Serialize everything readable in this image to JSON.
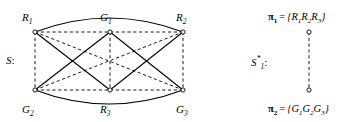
{
  "figure": {
    "left_diagram": {
      "set_label": {
        "base": "S",
        "colon": ":"
      },
      "nodes": [
        {
          "id": "R1",
          "base": "R",
          "sub": "1",
          "x": 35,
          "y": 32,
          "label_x": 22,
          "label_y": 12,
          "label_anchor": "start"
        },
        {
          "id": "G1",
          "base": "G",
          "sub": "1",
          "x": 110,
          "y": 32,
          "label_x": 100,
          "label_y": 12,
          "label_anchor": "start"
        },
        {
          "id": "R2",
          "base": "R",
          "sub": "2",
          "x": 183,
          "y": 32,
          "label_x": 176,
          "label_y": 12,
          "label_anchor": "start"
        },
        {
          "id": "G2",
          "base": "G",
          "sub": "2",
          "x": 35,
          "y": 90,
          "label_x": 22,
          "label_y": 104,
          "label_anchor": "start"
        },
        {
          "id": "R3",
          "base": "R",
          "sub": "3",
          "x": 110,
          "y": 90,
          "label_x": 100,
          "label_y": 104,
          "label_anchor": "start"
        },
        {
          "id": "G3",
          "base": "G",
          "sub": "3",
          "x": 183,
          "y": 90,
          "label_x": 176,
          "label_y": 104,
          "label_anchor": "start"
        }
      ],
      "edges": [
        {
          "name": "edge-R1-G1",
          "from": "R1",
          "to": "G1",
          "style": "dashed",
          "kind": "line"
        },
        {
          "name": "edge-G1-R2",
          "from": "G1",
          "to": "R2",
          "style": "dashed",
          "kind": "line"
        },
        {
          "name": "edge-G2-R3",
          "from": "G2",
          "to": "R3",
          "style": "dashed",
          "kind": "line"
        },
        {
          "name": "edge-R3-G3",
          "from": "R3",
          "to": "G3",
          "style": "dashed",
          "kind": "line"
        },
        {
          "name": "edge-R1-G2",
          "from": "R1",
          "to": "G2",
          "style": "dashed",
          "kind": "line"
        },
        {
          "name": "edge-G1-R3",
          "from": "G1",
          "to": "R3",
          "style": "dashed",
          "kind": "line"
        },
        {
          "name": "edge-R2-G3",
          "from": "R2",
          "to": "G3",
          "style": "dashed",
          "kind": "line"
        },
        {
          "name": "edge-R1-G3",
          "from": "R1",
          "to": "G3",
          "style": "dashed",
          "kind": "line"
        },
        {
          "name": "edge-G2-R2",
          "from": "G2",
          "to": "R2",
          "style": "dashed",
          "kind": "line"
        },
        {
          "name": "edge-R1-R3",
          "from": "R1",
          "to": "R3",
          "style": "solid",
          "kind": "line"
        },
        {
          "name": "edge-R2-R3",
          "from": "R2",
          "to": "R3",
          "style": "solid",
          "kind": "line"
        },
        {
          "name": "edge-G1-G2",
          "from": "G1",
          "to": "G2",
          "style": "solid",
          "kind": "line"
        },
        {
          "name": "edge-G1-G3",
          "from": "G1",
          "to": "G3",
          "style": "solid",
          "kind": "line"
        },
        {
          "name": "edge-R1-R2",
          "from": "R1",
          "to": "R2",
          "style": "solid",
          "kind": "arc",
          "bow": -28
        },
        {
          "name": "edge-G2-G3",
          "from": "G2",
          "to": "G3",
          "style": "solid",
          "kind": "arc",
          "bow": 28
        }
      ]
    },
    "right_diagram": {
      "set_label": {
        "base": "S",
        "sub": "1",
        "sup": "*",
        "colon": ":"
      },
      "partitions": [
        {
          "name": "partition-pi-1",
          "pi": "π",
          "pi_sub": "1",
          "eq": "=",
          "open": "{",
          "members": [
            {
              "base": "R",
              "sub": "1"
            },
            {
              "base": "R",
              "sub": "2"
            },
            {
              "base": "R",
              "sub": "3"
            }
          ],
          "close": "}",
          "x": 268,
          "y": 12
        },
        {
          "name": "partition-pi-2",
          "pi": "π",
          "pi_sub": "2",
          "eq": "=",
          "open": "{",
          "members": [
            {
              "base": "G",
              "sub": "1"
            },
            {
              "base": "G",
              "sub": "2"
            },
            {
              "base": "G",
              "sub": "3"
            }
          ],
          "close": "}",
          "x": 268,
          "y": 104
        }
      ],
      "connector": {
        "name": "partition-connector",
        "style": "dashed",
        "x": 309,
        "y1": 32,
        "y2": 90
      },
      "endpoints": [
        {
          "name": "partition-node-top",
          "x": 309,
          "y": 32
        },
        {
          "name": "partition-node-bottom",
          "x": 309,
          "y": 90
        }
      ]
    },
    "colors": {
      "ink": "#000000",
      "background": "#ffffff",
      "node_fill": "#ffffff"
    }
  }
}
